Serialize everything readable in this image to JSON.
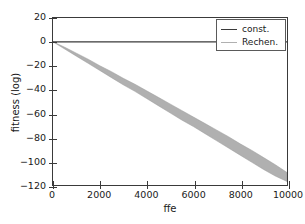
{
  "chart_data": {
    "type": "line",
    "title": "",
    "xlabel": "ffe",
    "ylabel": "fitness (log)",
    "xlim": [
      0,
      10000
    ],
    "ylim": [
      -120,
      20
    ],
    "xticks": [
      0,
      2000,
      4000,
      6000,
      8000,
      10000
    ],
    "yticks": [
      20,
      0,
      -20,
      -40,
      -60,
      -80,
      -100,
      -120
    ],
    "xticklabels": [
      "0",
      "2000",
      "4000",
      "6000",
      "8000",
      "10000"
    ],
    "yticklabels": [
      "20",
      "0",
      "-20",
      "-40",
      "-60",
      "-80",
      "-100",
      "-120"
    ],
    "grid": false,
    "legend_position": "upper right",
    "series": [
      {
        "name": "const.",
        "kind": "line",
        "color": "#3a3a3a",
        "x": [
          0,
          10000
        ],
        "values": [
          0,
          0
        ]
      },
      {
        "name": "Rechen.",
        "kind": "band",
        "color": "#b0b0b0",
        "edge_color": "#9a9a9a",
        "x": [
          0,
          500,
          1000,
          1500,
          2000,
          2500,
          3000,
          3500,
          4000,
          4500,
          5000,
          5500,
          6000,
          6500,
          7000,
          7500,
          8000,
          8500,
          9000,
          9500,
          10000
        ],
        "upper": [
          0,
          -4.5,
          -9.5,
          -14.5,
          -20.0,
          -25.0,
          -30.5,
          -35.5,
          -41.0,
          -46.5,
          -52.0,
          -57.5,
          -63.0,
          -68.5,
          -74.0,
          -79.5,
          -85.5,
          -91.0,
          -97.0,
          -103.0,
          -109.5
        ],
        "lower": [
          0,
          -6.0,
          -12.0,
          -18.0,
          -24.0,
          -30.0,
          -36.0,
          -41.5,
          -47.5,
          -53.5,
          -59.5,
          -65.5,
          -71.0,
          -77.0,
          -83.0,
          -89.0,
          -95.0,
          -101.0,
          -107.0,
          -112.5,
          -117.0
        ],
        "mean": [
          0,
          -5.2,
          -10.7,
          -16.2,
          -22.0,
          -27.5,
          -33.2,
          -38.5,
          -44.2,
          -50.0,
          -55.7,
          -61.5,
          -67.0,
          -72.7,
          -78.5,
          -84.2,
          -90.2,
          -96.0,
          -102.0,
          -107.7,
          -113.2
        ]
      }
    ],
    "legend_entries": [
      {
        "label": "const.",
        "color": "#3a3a3a"
      },
      {
        "label": "Rechen.",
        "color": "#b0b0b0"
      }
    ]
  }
}
